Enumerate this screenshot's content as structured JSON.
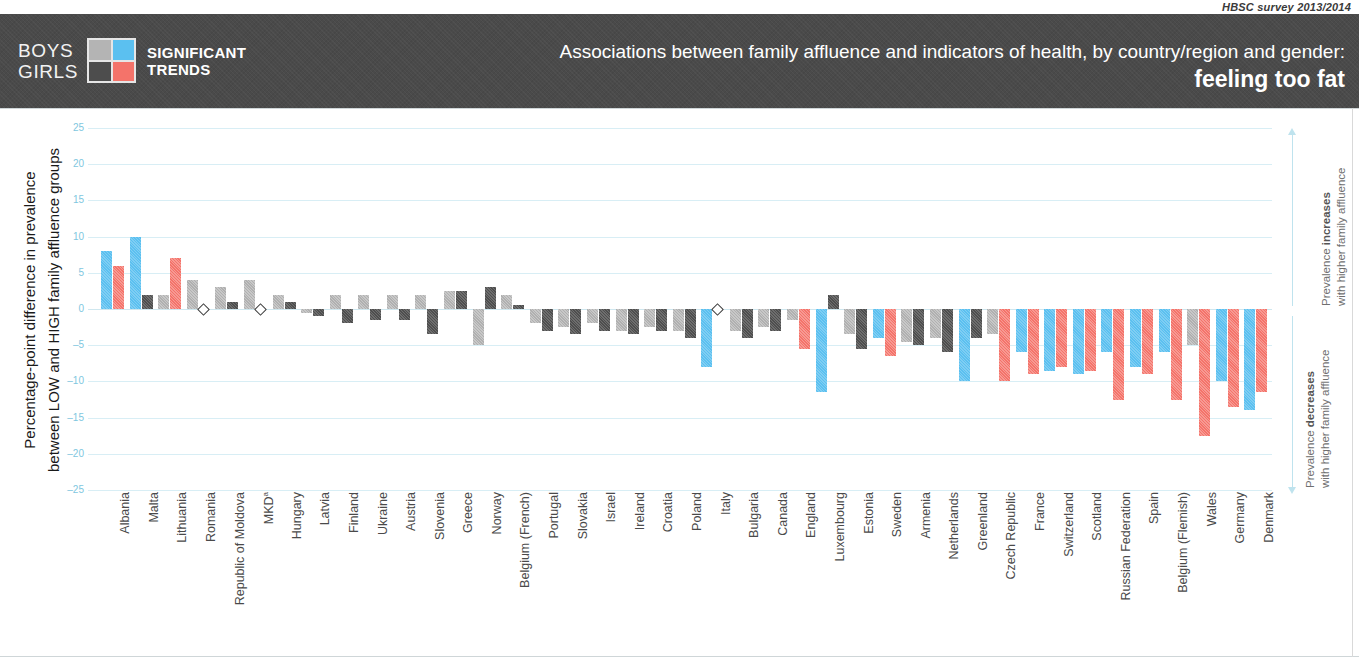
{
  "source_line": "HBSC survey 2013/2014",
  "legend": {
    "boys_label": "BOYS",
    "girls_label": "GIRLS",
    "caption_line1": "SIGNIFICANT",
    "caption_line2": "TRENDS",
    "swatches": [
      {
        "name": "boys-non-significant",
        "color": "#b0b0b0"
      },
      {
        "name": "boys-significant",
        "color": "#5bc0f0"
      },
      {
        "name": "girls-non-significant",
        "color": "#4e4e4e"
      },
      {
        "name": "girls-significant",
        "color": "#f4736a"
      }
    ]
  },
  "header": {
    "title_main": "Associations between family affluence and indicators of health, by country/region and gender:",
    "title_sub": "feeling too fat"
  },
  "annotations": {
    "increase_bold": "increases",
    "increase_pre": "Prevalence ",
    "increase_line2": "with higher family affluence",
    "decrease_bold": "decreases",
    "decrease_pre": "Prevalence ",
    "decrease_line2": "with higher family affluence"
  },
  "y_axis": {
    "title_line1": "Percentage-point difference in prevalence",
    "title_line2": "between LOW and HIGH family affluence groups"
  },
  "chart_data": {
    "type": "bar",
    "title": "Associations between family affluence and indicators of health, by country/region and gender: feeling too fat",
    "subtitle": "HBSC survey 2013/2014",
    "xlabel": "",
    "ylabel": "Percentage-point difference in prevalence between LOW and HIGH family affluence groups",
    "ylim": [
      -25,
      25
    ],
    "yticks": [
      25,
      20,
      15,
      10,
      5,
      0,
      -5,
      -10,
      -15,
      -20,
      -25
    ],
    "grid": true,
    "legend_position": "header",
    "categories": [
      "Albania",
      "Malta",
      "Lithuania",
      "Romania",
      "Republic of Moldova",
      "MKDᵃ",
      "Hungary",
      "Latvia",
      "Finland",
      "Ukraine",
      "Austria",
      "Slovenia",
      "Greece",
      "Norway",
      "Belgium (French)",
      "Portugal",
      "Slovakia",
      "Israel",
      "Ireland",
      "Croatia",
      "Poland",
      "Italy",
      "Bulgaria",
      "Canada",
      "England",
      "Luxembourg",
      "Estonia",
      "Sweden",
      "Armenia",
      "Netherlands",
      "Greenland",
      "Czech Republic",
      "France",
      "Switzerland",
      "Scotland",
      "Russian Federation",
      "Spain",
      "Belgium (Flemish)",
      "Wales",
      "Germany",
      "Denmark"
    ],
    "series": [
      {
        "name": "Boys",
        "values": [
          8,
          10,
          2,
          4,
          3,
          4,
          2,
          -0.5,
          2,
          2,
          2,
          2,
          2.5,
          -5,
          2,
          -2,
          -2.5,
          -2,
          -3,
          -2.5,
          -3,
          -8,
          -3,
          -2.5,
          -1.5,
          -11.5,
          -3.5,
          -4,
          -4.5,
          -4,
          -10,
          -3.5,
          -6,
          -8.5,
          -9,
          -6,
          -8,
          -6,
          -5,
          -10,
          -14
        ],
        "significance": [
          true,
          true,
          false,
          false,
          false,
          false,
          false,
          false,
          false,
          false,
          false,
          false,
          false,
          false,
          false,
          false,
          false,
          false,
          false,
          false,
          false,
          true,
          false,
          false,
          false,
          true,
          false,
          true,
          false,
          false,
          true,
          false,
          true,
          true,
          true,
          true,
          true,
          true,
          false,
          true,
          true
        ]
      },
      {
        "name": "Girls",
        "values": [
          6,
          2,
          7,
          0,
          1,
          0,
          1,
          -1,
          -2,
          -1.5,
          -1.5,
          -3.5,
          2.5,
          3,
          0.5,
          -3,
          -3.5,
          -3,
          -3.5,
          -3,
          -4,
          0,
          -4,
          -3,
          -5.5,
          2,
          -5.5,
          -6.5,
          -5,
          -6,
          -4,
          -10,
          -9,
          -8,
          -8.5,
          -12.5,
          -9,
          -12.5,
          -17.5,
          -13.5,
          -11.5
        ],
        "significance": [
          true,
          false,
          true,
          false,
          false,
          false,
          false,
          false,
          false,
          false,
          false,
          false,
          false,
          false,
          false,
          false,
          false,
          false,
          false,
          false,
          false,
          false,
          false,
          false,
          true,
          false,
          false,
          true,
          false,
          false,
          false,
          true,
          true,
          true,
          true,
          true,
          true,
          true,
          true,
          true,
          true
        ]
      }
    ],
    "markers": [
      {
        "category": "Romania",
        "series": "Girls",
        "value": 0,
        "symbol": "diamond"
      },
      {
        "category": "MKDᵃ",
        "series": "Girls",
        "value": 0,
        "symbol": "diamond"
      },
      {
        "category": "Italy",
        "series": "Girls",
        "value": 0,
        "symbol": "diamond"
      }
    ]
  }
}
